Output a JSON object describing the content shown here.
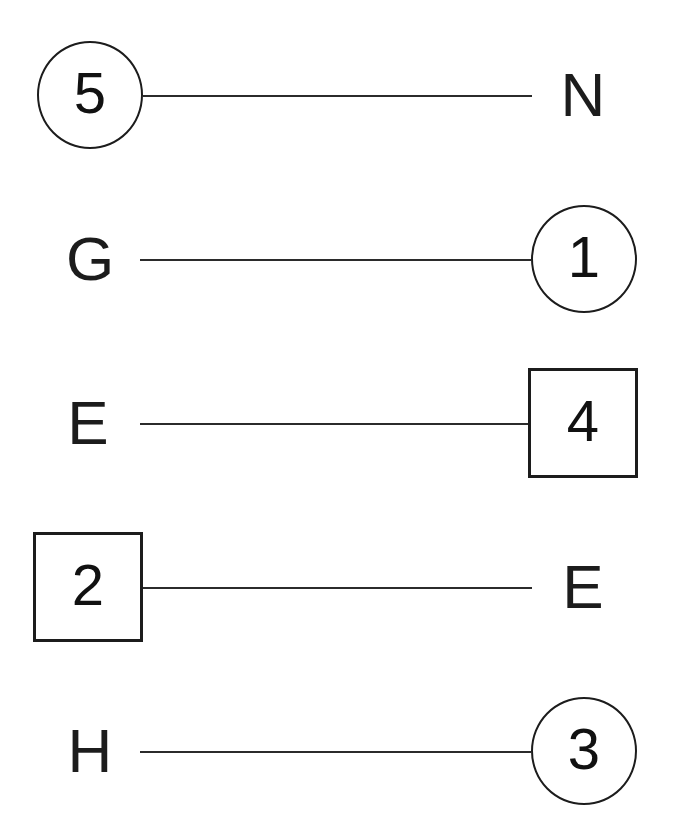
{
  "diagram": {
    "background_color": "#ffffff",
    "stroke_color": "#1c1c1c",
    "line_color": "#2b2b2b",
    "rows": [
      {
        "id": "row-1",
        "left": {
          "kind": "node-circle",
          "text": "5"
        },
        "right": {
          "kind": "letter",
          "text": "N"
        },
        "connector": {
          "y": 95,
          "x1": 143,
          "x2": 532
        }
      },
      {
        "id": "row-2",
        "left": {
          "kind": "letter",
          "text": "G"
        },
        "right": {
          "kind": "node-circle",
          "text": "1"
        },
        "connector": {
          "y": 259,
          "x1": 140,
          "x2": 531
        }
      },
      {
        "id": "row-3",
        "left": {
          "kind": "letter",
          "text": "E"
        },
        "right": {
          "kind": "node-square",
          "text": "4"
        },
        "connector": {
          "y": 423,
          "x1": 140,
          "x2": 528
        }
      },
      {
        "id": "row-4",
        "left": {
          "kind": "node-square",
          "text": "2"
        },
        "right": {
          "kind": "letter",
          "text": "E"
        },
        "connector": {
          "y": 587,
          "x1": 143,
          "x2": 532
        }
      },
      {
        "id": "row-5",
        "left": {
          "kind": "letter",
          "text": "H"
        },
        "right": {
          "kind": "node-circle",
          "text": "3"
        },
        "connector": {
          "y": 751,
          "x1": 140,
          "x2": 531
        }
      }
    ]
  }
}
